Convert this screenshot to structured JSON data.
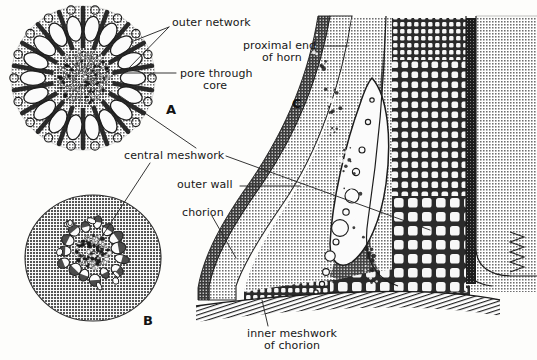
{
  "figure": {
    "kind": "scientific-illustration",
    "background_color": "#fdfdfb",
    "ink_color": "#171717",
    "palette": {
      "paper": "#fdfdfb",
      "light_stipple": "#b9b9b9",
      "mid_gray": "#8c8c8c",
      "dark_gray": "#4a4a4a",
      "near_black": "#1d1d1d",
      "lumen_white": "#fbfbfb",
      "leader_line": "#2a2a2a"
    },
    "panels": [
      {
        "letter": "A",
        "x": 166,
        "y": 102,
        "caption": "transverse section of horn — outer network and pore through core"
      },
      {
        "letter": "B",
        "x": 143,
        "y": 313,
        "caption": "transverse section of horn nearer the base"
      },
      {
        "letter": "C",
        "x": 292,
        "y": 96,
        "caption": "longitudinal section through proximal end of horn and chorion wall"
      }
    ],
    "labels": [
      {
        "id": "outer-network",
        "text": "outer network",
        "x": 172,
        "y": 17,
        "align": "left"
      },
      {
        "id": "pore-through",
        "text": "pore through",
        "x": 180,
        "y": 69,
        "align": "left"
      },
      {
        "id": "core",
        "text": "core",
        "x": 203,
        "y": 81,
        "align": "left"
      },
      {
        "id": "proximal-end",
        "text": "proximal end",
        "x": 243,
        "y": 41,
        "align": "left"
      },
      {
        "id": "of-horn",
        "text": "of horn",
        "x": 262,
        "y": 53,
        "align": "left"
      },
      {
        "id": "central-meshwork",
        "text": "central meshwork",
        "x": 125,
        "y": 152,
        "align": "left"
      },
      {
        "id": "outer-wall",
        "text": "outer wall",
        "x": 177,
        "y": 181,
        "align": "left"
      },
      {
        "id": "chorion",
        "text": "chorion",
        "x": 182,
        "y": 208,
        "align": "left"
      },
      {
        "id": "inner-meshwork",
        "text": "inner meshwork",
        "x": 248,
        "y": 330,
        "align": "left"
      },
      {
        "id": "of-chorion",
        "text": "of chorion",
        "x": 264,
        "y": 342,
        "align": "left"
      }
    ]
  }
}
